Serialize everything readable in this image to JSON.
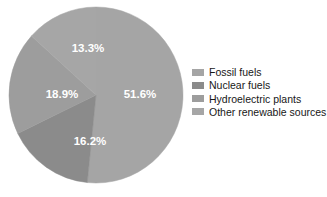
{
  "chart_data": {
    "type": "pie",
    "title": "",
    "categories": [
      "Fossil fuels",
      "Nuclear fuels",
      "Hydroelectric plants",
      "Other renewable sources"
    ],
    "values": [
      51.6,
      16.2,
      18.9,
      13.3
    ],
    "labels": [
      "51.6%",
      "16.2%",
      "18.9%",
      "13.3%"
    ],
    "unit": "%",
    "colors": [
      "#a3a3a3",
      "#8a8a8a",
      "#9b9b9b",
      "#a8a8a8"
    ],
    "legend_position": "right",
    "grid": false,
    "start_angle_deg": 0,
    "direction": "clockwise"
  },
  "slices": [
    {
      "label": "51.6%",
      "name": "Fossil fuels",
      "value": 51.6,
      "color": "#a5a5a5",
      "label_x": 132,
      "label_y": 89
    },
    {
      "label": "16.2%",
      "name": "Nuclear fuels",
      "value": 16.2,
      "color": "#8b8b8b",
      "label_x": 82,
      "label_y": 136
    },
    {
      "label": "18.9%",
      "name": "Hydroelectric plants",
      "value": 18.9,
      "color": "#9d9d9d",
      "label_x": 54,
      "label_y": 89
    },
    {
      "label": "13.3%",
      "name": "Other renewable sources",
      "value": 13.3,
      "color": "#a6a6a6",
      "label_x": 80,
      "label_y": 43
    }
  ],
  "legend": {
    "items": [
      {
        "label": "Fossil fuels",
        "color": "#a5a5a5"
      },
      {
        "label": "Nuclear fuels",
        "color": "#8b8b8b"
      },
      {
        "label": "Hydroelectric plants",
        "color": "#9d9d9d"
      },
      {
        "label": "Other renewable sources",
        "color": "#a6a6a6"
      }
    ]
  }
}
